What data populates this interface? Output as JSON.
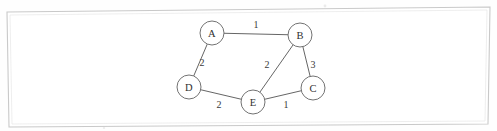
{
  "figure": {
    "canvas": {
      "width": 497,
      "height": 131
    },
    "background_color": "#fefefe",
    "border": {
      "name": "page-frame",
      "color": "#c9c9c9",
      "points": "7,12 490,7 488,124 9,127"
    },
    "node_style": {
      "radius": 12,
      "fill": "#ffffff",
      "stroke": "#6a6a6a"
    },
    "edge_style": {
      "stroke": "#5d5d5d",
      "width": 0.95
    }
  },
  "chart_data": {
    "type": "diagram",
    "diagram_kind": "undirected-weighted-graph",
    "title": "",
    "xlabel": "",
    "ylabel": "",
    "grid": false,
    "legend": false,
    "node_count": 5,
    "edge_count": 6,
    "nodes": [
      {
        "id": "A",
        "label": "A",
        "x": 212,
        "y": 33
      },
      {
        "id": "B",
        "label": "B",
        "x": 300,
        "y": 35
      },
      {
        "id": "C",
        "label": "C",
        "x": 313,
        "y": 88
      },
      {
        "id": "D",
        "label": "D",
        "x": 189,
        "y": 87
      },
      {
        "id": "E",
        "label": "E",
        "x": 253,
        "y": 102
      }
    ],
    "edges": [
      {
        "id": "A-B",
        "source": "A",
        "target": "B",
        "weight": 1,
        "label": "1",
        "label_x": 256,
        "label_y": 24
      },
      {
        "id": "A-D",
        "source": "A",
        "target": "D",
        "weight": 2,
        "label": "2",
        "label_x": 202,
        "label_y": 62
      },
      {
        "id": "B-E",
        "source": "B",
        "target": "E",
        "weight": 2,
        "label": "2",
        "label_x": 267,
        "label_y": 64
      },
      {
        "id": "B-C",
        "source": "B",
        "target": "C",
        "weight": 3,
        "label": "3",
        "label_x": 313,
        "label_y": 64
      },
      {
        "id": "D-E",
        "source": "D",
        "target": "E",
        "weight": 2,
        "label": "2",
        "label_x": 219,
        "label_y": 104
      },
      {
        "id": "E-C",
        "source": "E",
        "target": "C",
        "weight": 1,
        "label": "1",
        "label_x": 286,
        "label_y": 104
      }
    ],
    "adjacency_summary": "A-B:1, A-D:2, B-C:3, B-E:2, C-E:1, D-E:2"
  }
}
